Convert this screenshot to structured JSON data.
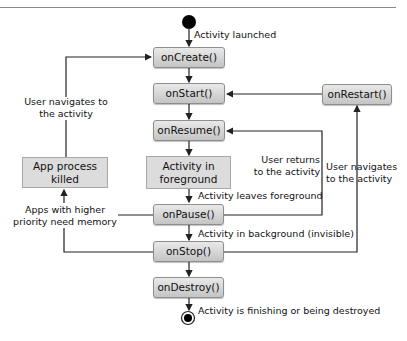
{
  "diagram": {
    "start_node": "start-dot",
    "end_node": "end-dot",
    "nodes": {
      "onCreate": "onCreate()",
      "onStart": "onStart()",
      "onResume": "onResume()",
      "foreground": "Activity in foreground",
      "foreground_l1": "Activity in",
      "foreground_l2": "foreground",
      "onPause": "onPause()",
      "onStop": "onStop()",
      "onDestroy": "onDestroy()",
      "onRestart": "onRestart()",
      "killed_l1": "App process",
      "killed_l2": "killed"
    },
    "labels": {
      "launched": "Activity launched",
      "user_nav_left_l1": "User navigates to",
      "user_nav_left_l2": "the activity",
      "user_returns_l1": "User returns",
      "user_returns_l2": "to the activity",
      "user_nav_right_l1": "User navigates",
      "user_nav_right_l2": "to the activity",
      "leaves_foreground": "Activity leaves foreground",
      "higher_priority_l1": "Apps with higher",
      "higher_priority_l2": "priority need memory",
      "background": "Activity in background (invisible)",
      "finishing": "Activity is finishing or being destroyed"
    },
    "edges": [
      {
        "from": "start",
        "to": "onCreate",
        "label": "Activity launched"
      },
      {
        "from": "onCreate",
        "to": "onStart"
      },
      {
        "from": "onStart",
        "to": "onResume"
      },
      {
        "from": "onResume",
        "to": "Activity in foreground"
      },
      {
        "from": "Activity in foreground",
        "to": "onPause",
        "label": "Activity leaves foreground"
      },
      {
        "from": "onPause",
        "to": "onStop",
        "label": "Activity in background (invisible)"
      },
      {
        "from": "onStop",
        "to": "onDestroy"
      },
      {
        "from": "onDestroy",
        "to": "end",
        "label": "Activity is finishing or being destroyed"
      },
      {
        "from": "onPause",
        "to": "onResume",
        "label": "User returns to the activity"
      },
      {
        "from": "onStop",
        "to": "onRestart",
        "label": "User navigates to the activity"
      },
      {
        "from": "onRestart",
        "to": "onStart"
      },
      {
        "from": "onPause",
        "to": "App process killed",
        "label": "Apps with higher priority need memory"
      },
      {
        "from": "onStop",
        "to": "App process killed",
        "label": "Apps with higher priority need memory"
      },
      {
        "from": "App process killed",
        "to": "onCreate",
        "label": "User navigates to the activity"
      }
    ],
    "colors": {
      "method_fill_top": "#e9e9e9",
      "method_fill_bottom": "#c4c4c4",
      "state_fill": "#dcdcdc",
      "line": "#222222"
    }
  }
}
